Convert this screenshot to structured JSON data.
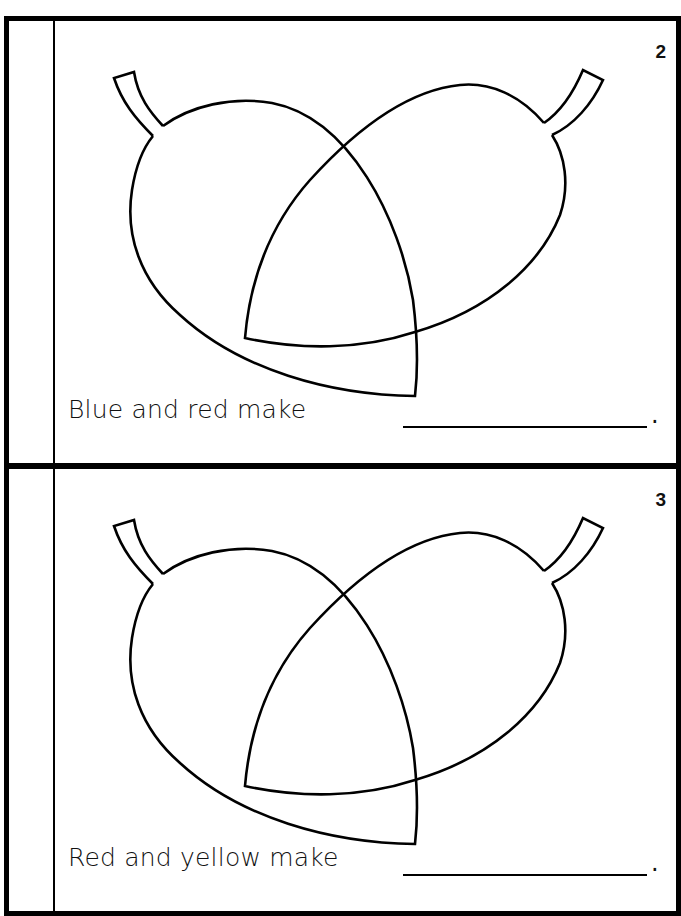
{
  "header": {
    "cutoff_text": ""
  },
  "pages": [
    {
      "page_number": "2",
      "sentence": "Blue and red make",
      "blank_value": "",
      "terminator": "."
    },
    {
      "page_number": "3",
      "sentence": "Red and yellow make",
      "blank_value": "",
      "terminator": "."
    }
  ],
  "colors": {
    "ink": "#000000",
    "paper": "#ffffff"
  }
}
